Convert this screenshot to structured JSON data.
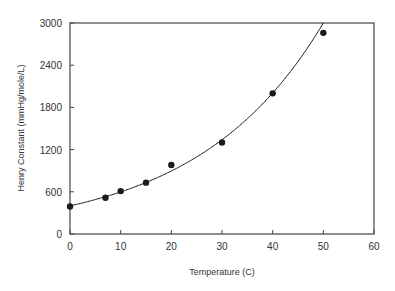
{
  "chart_data": {
    "type": "scatter",
    "title": "",
    "xlabel": "Temperature (C)",
    "ylabel": "Henry Constant (mmHg/mole/L)",
    "xlim": [
      0,
      60
    ],
    "ylim": [
      0,
      3000
    ],
    "xticks": [
      0,
      10,
      20,
      30,
      40,
      50,
      60
    ],
    "yticks": [
      0,
      600,
      1200,
      1800,
      2400,
      3000
    ],
    "grid": false,
    "legend": null,
    "series": [
      {
        "name": "Measured",
        "kind": "scatter",
        "marker": "filled-circle",
        "x": [
          0,
          7,
          10,
          15,
          20,
          30,
          40,
          50
        ],
        "y": [
          390,
          515,
          610,
          730,
          980,
          1300,
          2000,
          2860
        ]
      },
      {
        "name": "Exponential fit",
        "kind": "line",
        "equation": "y = 400 * exp(0.0403 * x)",
        "x": [
          0,
          5,
          10,
          15,
          20,
          25,
          30,
          35,
          40,
          45,
          50
        ],
        "y": [
          400,
          489,
          598,
          731,
          893,
          1092,
          1335,
          1632,
          1995,
          2439,
          2981
        ]
      }
    ]
  },
  "colors": {
    "ink": "#1a1a1a",
    "axis": "#444444",
    "background": "#ffffff"
  }
}
